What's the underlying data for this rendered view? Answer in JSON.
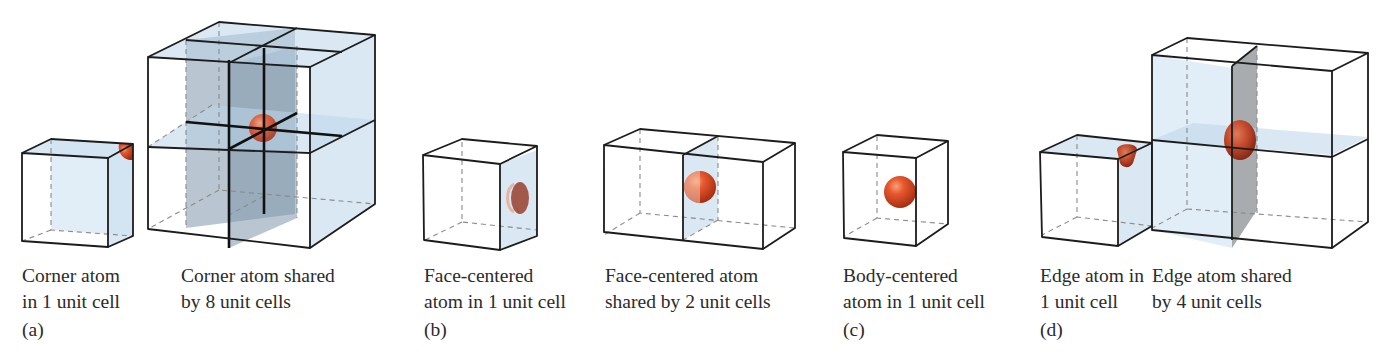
{
  "figure": {
    "type": "unit-cell-atom-sharing-diagram",
    "colors": {
      "atom": "#e0522c",
      "atom_dark": "#9c2a12",
      "face_tint": "#bcd6ea",
      "shaded_plane": "#7f97ab",
      "edge_line": "#1c1c1c",
      "hidden_line": "#8a8a8a"
    },
    "panels": [
      {
        "label": "(a)",
        "items": [
          {
            "caption_line1": "Corner atom",
            "caption_line2": "in 1 unit cell",
            "atom_fraction": "1/8"
          },
          {
            "caption_line1": "Corner atom shared",
            "caption_line2": "by 8 unit cells",
            "cells": 8
          }
        ]
      },
      {
        "label": "(b)",
        "items": [
          {
            "caption_line1": "Face-centered",
            "caption_line2": "atom in 1 unit cell",
            "atom_fraction": "1/2"
          },
          {
            "caption_line1": "Face-centered atom",
            "caption_line2": "shared by 2 unit cells",
            "cells": 2
          }
        ]
      },
      {
        "label": "(c)",
        "items": [
          {
            "caption_line1": "Body-centered",
            "caption_line2": "atom in 1 unit cell",
            "atom_fraction": "1"
          }
        ]
      },
      {
        "label": "(d)",
        "items": [
          {
            "caption_line1": "Edge atom in",
            "caption_line2": "1 unit cell",
            "atom_fraction": "1/4"
          },
          {
            "caption_line1": "Edge atom shared",
            "caption_line2": "by 4 unit cells",
            "cells": 4
          }
        ]
      }
    ]
  }
}
